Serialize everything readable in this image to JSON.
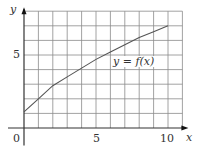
{
  "chart_data": {
    "type": "line",
    "title": "",
    "xlabel": "x",
    "ylabel": "y",
    "xlim": [
      0,
      11
    ],
    "ylim": [
      0,
      8
    ],
    "grid": true,
    "x_ticks": [
      "0",
      "5",
      "10"
    ],
    "y_ticks": [
      "5"
    ],
    "series": [
      {
        "name": "y = f(x)",
        "x": [
          0,
          1,
          2,
          3,
          4,
          5,
          6,
          7,
          8,
          9,
          10
        ],
        "values": [
          1.1,
          2.0,
          2.9,
          3.5,
          4.1,
          4.7,
          5.2,
          5.7,
          6.2,
          6.6,
          7.0
        ]
      }
    ],
    "annotations": [
      {
        "text": "y = f(x)",
        "x": 7.5,
        "y": 4.2
      }
    ],
    "colors": {
      "grid": "#8a8a8a",
      "curve": "#555555",
      "axis": "#333333"
    }
  },
  "labels": {
    "y_axis": "y",
    "x_axis": "x",
    "origin": "0",
    "x5": "5",
    "x10": "10",
    "y5": "5",
    "curve": "y = f(x)"
  }
}
